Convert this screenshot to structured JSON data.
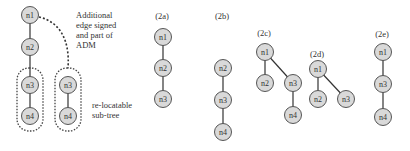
{
  "diagram": {
    "main": {
      "annotation_edge": [
        "Additional",
        "edge signed",
        "and part of",
        "ADM"
      ],
      "annotation_subtree": [
        "re-locatable",
        "sub-tree"
      ],
      "nodes": [
        {
          "id": "n1",
          "label": "n1",
          "x": 30,
          "y": 15
        },
        {
          "id": "n2",
          "label": "n2",
          "x": 30,
          "y": 47
        },
        {
          "id": "n3",
          "label": "n3",
          "x": 30,
          "y": 85
        },
        {
          "id": "n4",
          "label": "n4",
          "x": 30,
          "y": 116
        },
        {
          "id": "n3b",
          "label": "n3",
          "x": 68,
          "y": 85
        },
        {
          "id": "n4b",
          "label": "n4",
          "x": 68,
          "y": 116
        }
      ]
    },
    "panels": [
      {
        "id": "2a",
        "label": "(2a)",
        "nodes": [
          "n1",
          "n2",
          "n3"
        ]
      },
      {
        "id": "2b",
        "label": "(2b)",
        "nodes": [
          "n2",
          "n3",
          "n4"
        ]
      },
      {
        "id": "2c",
        "label": "(2c)",
        "nodes": [
          "n1",
          "n2",
          "n3",
          "n4"
        ]
      },
      {
        "id": "2d",
        "label": "(2d)",
        "nodes": [
          "n1",
          "n2",
          "n3"
        ]
      },
      {
        "id": "2e",
        "label": "(2e)",
        "nodes": [
          "n1",
          "n3",
          "n4"
        ]
      }
    ]
  }
}
